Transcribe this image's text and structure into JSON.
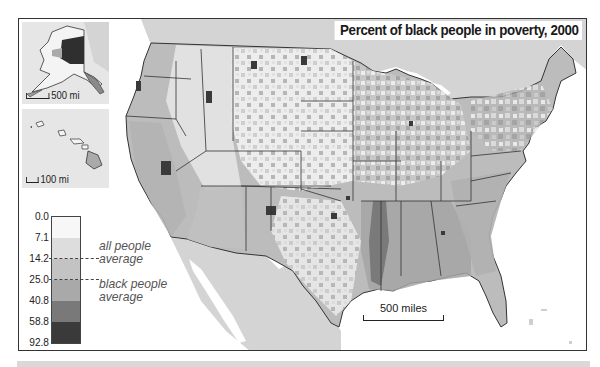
{
  "title": "Percent of black people in poverty, 2000",
  "insets": {
    "alaska": {
      "scale_label": "500 mi"
    },
    "hawaii": {
      "scale_label": "100 mi"
    }
  },
  "scale": {
    "label": "500 miles"
  },
  "legend": {
    "ticks": [
      "0.0",
      "7.1",
      "14.2",
      "25.0",
      "40.8",
      "58.8",
      "92.8"
    ],
    "bands": [
      {
        "from": 0.0,
        "to": 7.1,
        "color": "#f7f7f7"
      },
      {
        "from": 7.1,
        "to": 14.2,
        "color": "#dddddd"
      },
      {
        "from": 14.2,
        "to": 25.0,
        "color": "#c3c3c3"
      },
      {
        "from": 25.0,
        "to": 40.8,
        "color": "#a9a9a9"
      },
      {
        "from": 40.8,
        "to": 58.8,
        "color": "#797979"
      },
      {
        "from": 58.8,
        "to": 92.8,
        "color": "#3a3a3a"
      }
    ],
    "markers": [
      {
        "value": 14.2,
        "label_line1": "all people",
        "label_line2": "average"
      },
      {
        "value": 25.0,
        "label_line1": "black people",
        "label_line2": "average"
      }
    ]
  },
  "colors": {
    "land_neighbors": "#d4d4d4",
    "water": "#ffffff",
    "border": "#333333"
  }
}
